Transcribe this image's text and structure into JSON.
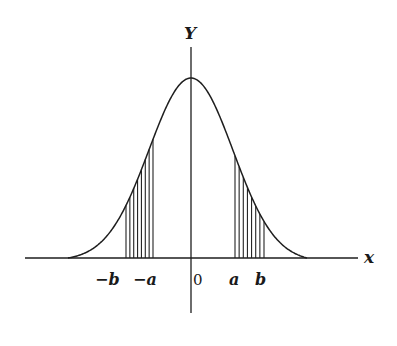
{
  "figure": {
    "y_axis_label": "Y",
    "x_axis_label": "x",
    "tick_labels": {
      "neg_b": "−b",
      "neg_a": "−a",
      "zero": "0",
      "a": "a",
      "b": "b"
    },
    "colors": {
      "ink": "#1e1e1e",
      "background": "#ffffff"
    }
  },
  "geometry": {
    "origin_x": 191,
    "baseline_y": 258,
    "peak_height": 180,
    "sigma_px": 42,
    "curve_left_x": 68,
    "curve_right_x": 307,
    "x_axis": {
      "x1": 25,
      "x2": 358
    },
    "y_axis": {
      "y1": 47,
      "y2": 313
    },
    "shaded_left": {
      "x_from": 126,
      "x_to": 153,
      "lines": 8
    },
    "shaded_right": {
      "x_from": 235,
      "x_to": 264,
      "lines": 8
    }
  }
}
